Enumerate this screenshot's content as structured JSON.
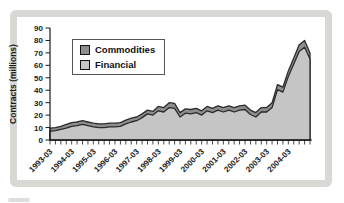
{
  "figure": {
    "background": "#ffffff",
    "frame_color": "#d8d8d5",
    "axis_color": "#1a1a1a",
    "area_edge_color": "#2b2b2b",
    "text_color": "#1a1a1a"
  },
  "legend": {
    "items": [
      {
        "label": "Commodities",
        "color": "#8e8e8e"
      },
      {
        "label": "Financial",
        "color": "#c5c5c5"
      }
    ]
  },
  "chart_data": {
    "type": "area",
    "stacked": true,
    "title": "",
    "xlabel": "",
    "ylabel": "Contracts (millions)",
    "ylim": [
      0,
      90
    ],
    "yticks": [
      0,
      10,
      20,
      30,
      40,
      50,
      60,
      70,
      80,
      90
    ],
    "grid": false,
    "legend_position": "upper-left",
    "x_tick_labels": [
      "1993-03",
      "1994-03",
      "1995-03",
      "1996-03",
      "1997-03",
      "1998-03",
      "1999-03",
      "2000-03",
      "2001-03",
      "2002-03",
      "2003-03",
      "2004-03"
    ],
    "x_major_every": 4,
    "categories": [
      "1993-03",
      "1993-06",
      "1993-09",
      "1993-12",
      "1994-03",
      "1994-06",
      "1994-09",
      "1994-12",
      "1995-03",
      "1995-06",
      "1995-09",
      "1995-12",
      "1996-03",
      "1996-06",
      "1996-09",
      "1996-12",
      "1997-03",
      "1997-06",
      "1997-09",
      "1997-12",
      "1998-03",
      "1998-06",
      "1998-09",
      "1998-12",
      "1999-03",
      "1999-06",
      "1999-09",
      "1999-12",
      "2000-03",
      "2000-06",
      "2000-09",
      "2000-12",
      "2001-03",
      "2001-06",
      "2001-09",
      "2001-12",
      "2002-03",
      "2002-06",
      "2002-09",
      "2002-12",
      "2003-03",
      "2003-06",
      "2003-09",
      "2003-12",
      "2004-03",
      "2004-06",
      "2004-09",
      "2004-12",
      "2005-03"
    ],
    "series": [
      {
        "name": "Financial",
        "color": "#c5c5c5",
        "values": [
          7,
          7.5,
          8.5,
          9.5,
          11,
          11.5,
          12.5,
          11.5,
          10.5,
          10,
          10,
          10.5,
          10.5,
          11,
          13,
          14.5,
          15.5,
          18,
          21,
          20,
          23.5,
          22.5,
          26,
          25.5,
          18.5,
          21.5,
          21,
          22,
          20,
          23.5,
          22,
          24,
          22.5,
          24,
          22.5,
          24,
          24.5,
          20.5,
          18.5,
          22.5,
          22.5,
          26,
          40.5,
          38.5,
          51,
          61,
          71,
          74.5,
          65
        ]
      },
      {
        "name": "Commodities",
        "color": "#8e8e8e",
        "values": [
          2.5,
          2.5,
          2.5,
          3,
          3,
          3,
          3,
          3,
          3,
          3,
          3,
          3,
          3,
          3,
          3,
          3,
          3,
          3,
          3,
          3,
          3.5,
          3.5,
          4,
          4,
          3.5,
          3.5,
          3.5,
          3.5,
          3.5,
          3.5,
          3.5,
          3.5,
          3.5,
          3.5,
          3.5,
          3.5,
          3.5,
          3.5,
          3.5,
          3.5,
          3.5,
          4,
          4,
          4,
          4.5,
          5,
          5.5,
          5.5,
          5
        ]
      }
    ]
  }
}
